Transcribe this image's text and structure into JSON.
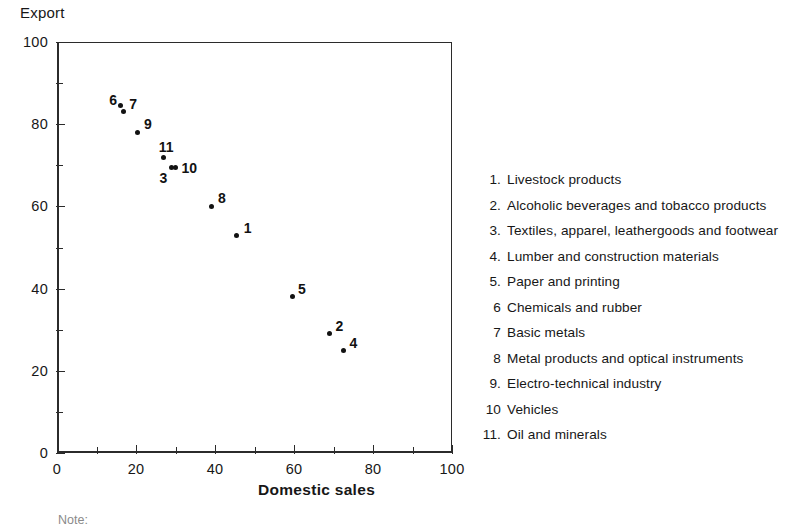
{
  "chart_data": {
    "type": "scatter",
    "title": "",
    "ylabel": "Export",
    "xlabel": "Domestic sales",
    "xlim": [
      0,
      100
    ],
    "ylim": [
      0,
      100
    ],
    "x_ticks": [
      0,
      20,
      40,
      60,
      80,
      100
    ],
    "y_ticks": [
      0,
      20,
      40,
      60,
      80,
      100
    ],
    "x_minor_ticks": [
      10,
      30,
      50,
      70,
      90
    ],
    "y_minor_ticks": [
      10,
      30,
      50,
      70,
      90
    ],
    "grid": false,
    "legend_position": "right",
    "points": [
      {
        "id": "1",
        "x": 45.5,
        "y": 53.0,
        "label": "1",
        "label_dx": 7,
        "label_dy": -15,
        "name": "Livestock products"
      },
      {
        "id": "2",
        "x": 69.0,
        "y": 29.0,
        "label": "2",
        "label_dx": 6,
        "label_dy": -16,
        "name": "Alcoholic beverages and tobacco products"
      },
      {
        "id": "3",
        "x": 29.0,
        "y": 69.5,
        "label": "3",
        "label_dx": -12,
        "label_dy": 3,
        "name": "Textiles, apparel, leathergoods and footwear"
      },
      {
        "id": "4",
        "x": 72.5,
        "y": 25.0,
        "label": "4",
        "label_dx": 6,
        "label_dy": -15,
        "name": "Lumber and construction materials"
      },
      {
        "id": "5",
        "x": 59.5,
        "y": 38.0,
        "label": "5",
        "label_dx": 6,
        "label_dy": -16,
        "name": "Paper and printing"
      },
      {
        "id": "6",
        "x": 16.0,
        "y": 84.5,
        "label": "6",
        "label_dx": -11,
        "label_dy": -14,
        "name": "Chemicals and rubber"
      },
      {
        "id": "7",
        "x": 16.8,
        "y": 83.0,
        "label": "7",
        "label_dx": 6,
        "label_dy": -16,
        "name": "Basic metals"
      },
      {
        "id": "8",
        "x": 39.0,
        "y": 60.0,
        "label": "8",
        "label_dx": 7,
        "label_dy": -16,
        "name": "Metal products and optical instruments"
      },
      {
        "id": "9",
        "x": 20.5,
        "y": 78.0,
        "label": "9",
        "label_dx": 6,
        "label_dy": -16,
        "name": "Electro-technical industry"
      },
      {
        "id": "10",
        "x": 30.0,
        "y": 69.5,
        "label": "10",
        "label_dx": 6,
        "label_dy": -7,
        "name": "Vehicles"
      },
      {
        "id": "11",
        "x": 27.0,
        "y": 72.0,
        "label": "11",
        "label_dx": -5,
        "label_dy": -18,
        "name": "Oil and minerals"
      }
    ]
  },
  "legend": {
    "items": [
      {
        "num": "1.",
        "text": "Livestock products"
      },
      {
        "num": "2.",
        "text": "Alcoholic beverages and tobacco products"
      },
      {
        "num": "3.",
        "text": "Textiles, apparel, leathergoods and footwear"
      },
      {
        "num": "4.",
        "text": "Lumber and construction materials"
      },
      {
        "num": "5.",
        "text": "Paper and printing"
      },
      {
        "num": "6",
        "text": "Chemicals and rubber"
      },
      {
        "num": "7",
        "text": "Basic metals"
      },
      {
        "num": "8",
        "text": "Metal products and optical instruments"
      },
      {
        "num": "9.",
        "text": "Electro-technical industry"
      },
      {
        "num": "10",
        "text": "Vehicles"
      },
      {
        "num": "11.",
        "text": "Oil and minerals"
      }
    ]
  },
  "footer": {
    "note": "Note:"
  }
}
